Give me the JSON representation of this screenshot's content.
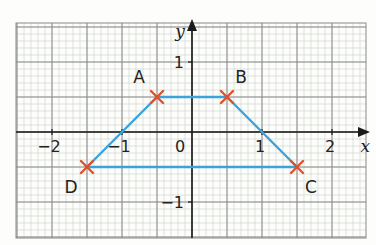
{
  "diagram": {
    "type": "coordinate-grid-trapezium",
    "axes": {
      "x_label": "x",
      "y_label": "y",
      "x_ticks": [
        {
          "value": -2,
          "label": "−2"
        },
        {
          "value": -1,
          "label": "−1"
        },
        {
          "value": 0,
          "label": "0"
        },
        {
          "value": 1,
          "label": "1"
        },
        {
          "value": 2,
          "label": "2"
        }
      ],
      "y_ticks": [
        {
          "value": 1,
          "label": "1"
        },
        {
          "value": -1,
          "label": "−1"
        }
      ],
      "x_range": [
        -2.5,
        2.5
      ],
      "y_range": [
        -1.5,
        1.5
      ]
    },
    "points": [
      {
        "name": "A",
        "x": -0.5,
        "y": 0.5
      },
      {
        "name": "B",
        "x": 0.5,
        "y": 0.5
      },
      {
        "name": "C",
        "x": 1.5,
        "y": -0.5
      },
      {
        "name": "D",
        "x": -1.5,
        "y": -0.5
      }
    ],
    "polygon_order": [
      "A",
      "B",
      "C",
      "D"
    ],
    "colors": {
      "shape_line": "#3aa3dc",
      "point_marker": "#e2502a",
      "grid_major": "#8a8a8a",
      "grid_minor": "#cfd6cf",
      "axis": "#1a1a1a"
    }
  }
}
